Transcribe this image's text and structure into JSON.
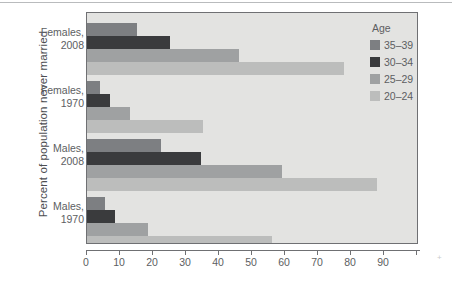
{
  "chart_data": {
    "type": "bar",
    "orientation": "horizontal",
    "title": "",
    "xlabel": "",
    "ylabel": "Percent of population never married",
    "xlim": [
      0,
      100
    ],
    "xticks": [
      0,
      10,
      20,
      30,
      40,
      50,
      60,
      70,
      80,
      90
    ],
    "xtick_labels": [
      "0",
      "10",
      "20",
      "30",
      "40",
      "50",
      "60",
      "70",
      "80",
      "90"
    ],
    "grid": false,
    "categories": [
      "Females, 2008",
      "Females, 1970",
      "Males, 2008",
      "Males, 1970"
    ],
    "category_lines": [
      [
        "Females,",
        "2008"
      ],
      [
        "Females,",
        "1970"
      ],
      [
        "Males,",
        "2008"
      ],
      [
        "Males,",
        "1970"
      ]
    ],
    "legend": {
      "title": "Age",
      "position": "right",
      "entries": [
        "35–39",
        "30–34",
        "25–29",
        "20–24"
      ]
    },
    "series": [
      {
        "name": "35–39",
        "color": "#7d7f82",
        "values": [
          15,
          4,
          22.5,
          5.5
        ]
      },
      {
        "name": "30–34",
        "color": "#3a3b3d",
        "values": [
          25,
          7,
          34.5,
          8.5
        ]
      },
      {
        "name": "25–29",
        "color": "#9fa1a2",
        "values": [
          46,
          13,
          59,
          18.5
        ]
      },
      {
        "name": "20–24",
        "color": "#bcbdbc",
        "values": [
          78,
          35,
          88,
          56
        ]
      }
    ]
  },
  "colors": {
    "plot_background": "#e3e3e1",
    "frame": "#6f7073",
    "text": "#5d5e62"
  }
}
